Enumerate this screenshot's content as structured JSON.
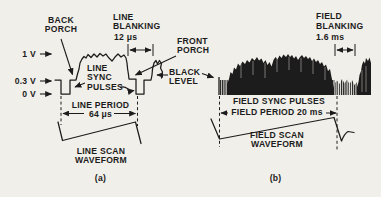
{
  "figure": {
    "colors": {
      "ink": "#1c1c1c",
      "paper": "#f1efe9"
    },
    "panel_a": {
      "label": "(a)",
      "voltages": {
        "v1": "1 V",
        "v03": "0.3 V",
        "v0": "0 V"
      },
      "annotations": {
        "back_porch": "BACK\nPORCH",
        "line_blanking": "LINE\nBLANKING",
        "line_blanking_value": "12 μs",
        "front_porch": "FRONT\nPORCH",
        "line_sync_pulses": "LINE\nSYNC\nPULSES",
        "black_level": "BLACK\nLEVEL",
        "line_period": "LINE PERIOD",
        "line_period_value": "64 μs",
        "line_scan_waveform": "LINE SCAN\nWAVEFORM"
      }
    },
    "panel_b": {
      "label": "(b)",
      "annotations": {
        "field_blanking": "FIELD\nBLANKING",
        "field_blanking_value": "1.6 ms",
        "field_sync_pulses": "FIELD SYNC PULSES",
        "field_period": "FIELD PERIOD 20 ms",
        "field_scan_waveform": "FIELD SCAN\nWAVEFORM"
      }
    }
  }
}
